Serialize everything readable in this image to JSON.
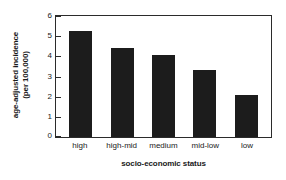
{
  "chart_data": {
    "type": "bar",
    "title": "",
    "categories": [
      "high",
      "high-mid",
      "medium",
      "mid-low",
      "low"
    ],
    "values": [
      5.25,
      4.4,
      4.05,
      3.3,
      2.1
    ],
    "xlabel": "socio-economic status",
    "ylabel_line1": "age-adjusted incidence",
    "ylabel_line2": "(per 100,000)",
    "ylim": [
      0,
      6
    ],
    "yticks": [
      0,
      1,
      2,
      3,
      4,
      5,
      6
    ],
    "ytick_labels": [
      "0",
      "1",
      "2",
      "3",
      "4",
      "5",
      "6"
    ],
    "grid": false,
    "legend": false,
    "bar_color": "#1c1c1c",
    "axis_color": "#2b2b2b",
    "background": "#ffffff"
  }
}
